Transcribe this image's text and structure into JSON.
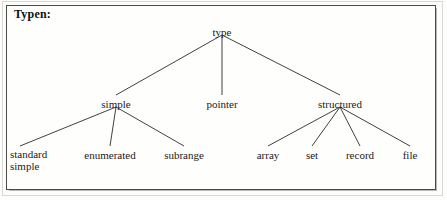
{
  "figure": {
    "title": "Typen:",
    "border_color": "#4a4a4a",
    "background_color": "#fefefd",
    "line_color": "#2b2b2b",
    "text_color": "#1a1a1a"
  },
  "tree": {
    "root": {
      "id": "type",
      "label": "type",
      "x": 222,
      "y": 32
    },
    "level2": [
      {
        "id": "simple",
        "label": "simple",
        "x": 116,
        "y": 104
      },
      {
        "id": "pointer",
        "label": "pointer",
        "x": 222,
        "y": 104
      },
      {
        "id": "structured",
        "label": "structured",
        "x": 340,
        "y": 104
      }
    ],
    "level3": [
      {
        "id": "standard-simple",
        "label": "standard simple",
        "line1": "standard",
        "line2": "simple",
        "x": 40,
        "y": 155,
        "two_line": true
      },
      {
        "id": "enumerated",
        "label": "enumerated",
        "x": 110,
        "y": 155,
        "two_line": false
      },
      {
        "id": "subrange",
        "label": "subrange",
        "x": 184,
        "y": 155,
        "two_line": false
      },
      {
        "id": "array",
        "label": "array",
        "x": 268,
        "y": 155,
        "two_line": false
      },
      {
        "id": "set",
        "label": "set",
        "x": 312,
        "y": 155,
        "two_line": false
      },
      {
        "id": "record",
        "label": "record",
        "x": 360,
        "y": 155,
        "two_line": false
      },
      {
        "id": "file",
        "label": "file",
        "x": 410,
        "y": 155,
        "two_line": false
      }
    ],
    "edges": [
      {
        "from": "type",
        "to": "simple"
      },
      {
        "from": "type",
        "to": "pointer"
      },
      {
        "from": "type",
        "to": "structured"
      },
      {
        "from": "simple",
        "to": "standard-simple"
      },
      {
        "from": "simple",
        "to": "enumerated"
      },
      {
        "from": "simple",
        "to": "subrange"
      },
      {
        "from": "structured",
        "to": "array"
      },
      {
        "from": "structured",
        "to": "set"
      },
      {
        "from": "structured",
        "to": "record"
      },
      {
        "from": "structured",
        "to": "file"
      }
    ]
  }
}
